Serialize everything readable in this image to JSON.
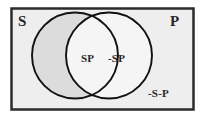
{
  "figure": {
    "type": "venn-2-set",
    "universe": {
      "name": "universe-rectangle",
      "fill": "#eeeeee",
      "border": "#2b2b2b"
    },
    "sets": [
      {
        "id": "S",
        "label": "S",
        "position": "top-left",
        "shaded": true,
        "fill": "#dcdcdc",
        "stroke": "#111111"
      },
      {
        "id": "P",
        "label": "P",
        "position": "top-right",
        "shaded": false,
        "fill": "#f4f4f4",
        "stroke": "#111111"
      }
    ],
    "regions": [
      {
        "id": "intersection",
        "label": "SP",
        "description": "S and P",
        "shaded": false
      },
      {
        "id": "p-only",
        "label": "-SP",
        "description": "not-S and P",
        "shaded": false
      },
      {
        "id": "outside",
        "label": "-S-P",
        "description": "not-S and not-P",
        "shaded": false
      }
    ]
  },
  "labels": {
    "set_s": "S",
    "set_p": "P",
    "intersection": "SP",
    "p_only": "-SP",
    "outside": "-S-P"
  },
  "colors": {
    "background": "#ffffff",
    "universe_fill": "#eeeeee",
    "universe_border": "#2b2b2b",
    "shaded_fill": "#dcdcdc",
    "unshaded_fill": "#f4f4f4",
    "circle_stroke": "#111111",
    "text": "#272727"
  }
}
